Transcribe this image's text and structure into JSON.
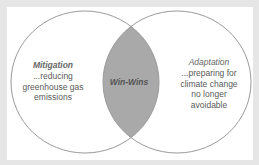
{
  "diagram": {
    "type": "venn",
    "colors": {
      "background": "#e6e6e6",
      "panel": "#ffffff",
      "circle_stroke": "#9a9a9a",
      "overlap_fill": "#a9a9a9",
      "text": "#5a5a5a"
    },
    "left": {
      "title": "Mitigation",
      "lines": [
        "...reducing",
        "greenhouse gas",
        "emissions"
      ]
    },
    "right": {
      "title": "Adaptation",
      "lines": [
        "...preparing for",
        "climate change",
        "no longer",
        "avoidable"
      ]
    },
    "overlap": {
      "title": "Win-Wins"
    }
  }
}
